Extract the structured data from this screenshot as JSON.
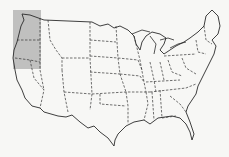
{
  "map": {
    "subject": "Contiguous United States outline map",
    "highlight": {
      "region": "Pacific Northwest (Washington and Oregon)",
      "color": "#b9b9b9",
      "x": 13,
      "y": 10,
      "width": 28,
      "height": 59
    },
    "colors": {
      "background": "#f7f7f5",
      "outline": "#2a2a2a",
      "state_borders": "#333333"
    }
  }
}
